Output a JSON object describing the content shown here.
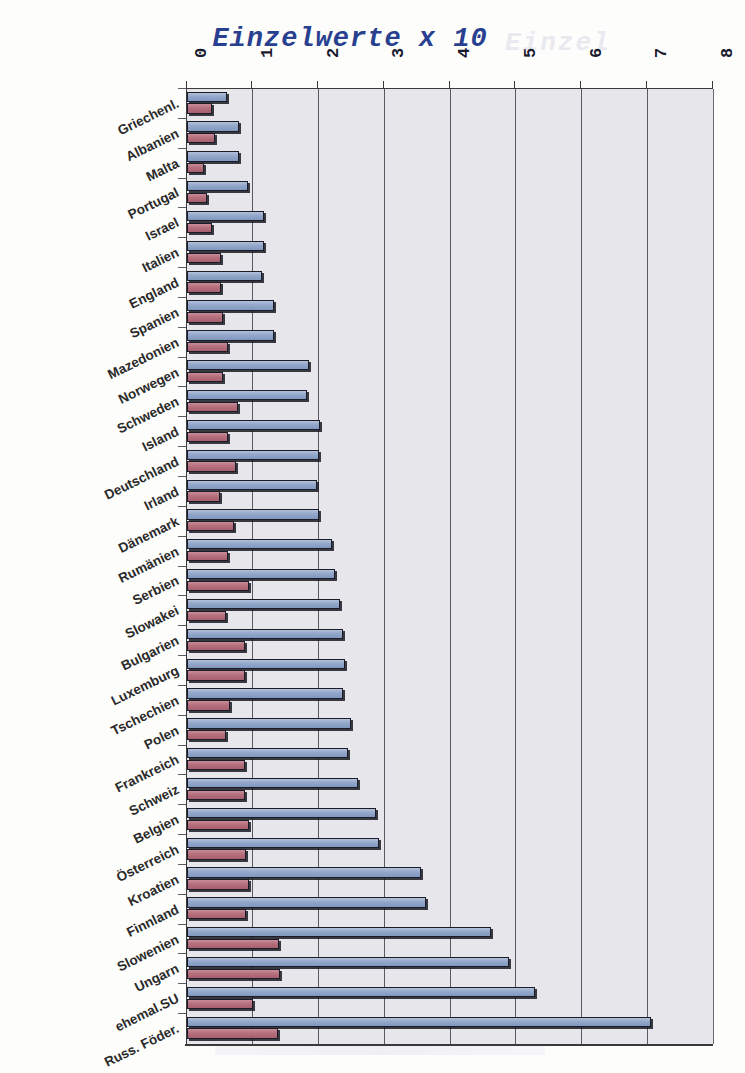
{
  "chart_data": {
    "type": "bar",
    "orientation": "horizontal",
    "title": "Einzelwerte x 10",
    "xlabel": "",
    "ylabel": "",
    "xlim": [
      0,
      8
    ],
    "xticks": [
      "0",
      "1",
      "2",
      "3",
      "4",
      "5",
      "6",
      "7",
      "8"
    ],
    "grid": "vertical",
    "legend_position": "none",
    "categories": [
      "Griechenl.",
      "Albanien",
      "Malta",
      "Portugal",
      "Israel",
      "Italien",
      "England",
      "Spanien",
      "Mazedonien",
      "Norwegen",
      "Schweden",
      "Island",
      "Deutschland",
      "Irland",
      "Dänemark",
      "Rumänien",
      "Serbien",
      "Slowakei",
      "Bulgarien",
      "Luxemburg",
      "Tschechien",
      "Polen",
      "Frankreich",
      "Schweiz",
      "Belgien",
      "Österreich",
      "Kroatien",
      "Finnland",
      "Slowenien",
      "Ungarn",
      "ehemal.SU",
      "Russ. Föder."
    ],
    "series": [
      {
        "name": "blau",
        "color": "#93a7ca",
        "values": [
          0.61,
          0.79,
          0.79,
          0.93,
          1.17,
          1.17,
          1.14,
          1.33,
          1.33,
          1.86,
          1.83,
          2.02,
          2.0,
          1.98,
          2.0,
          2.2,
          2.25,
          2.33,
          2.38,
          2.4,
          2.38,
          2.5,
          2.45,
          2.6,
          2.88,
          2.92,
          3.56,
          3.63,
          4.62,
          4.9,
          5.3,
          7.05
        ]
      },
      {
        "name": "rot",
        "color": "#b5707e",
        "values": [
          0.38,
          0.42,
          0.26,
          0.3,
          0.38,
          0.52,
          0.52,
          0.55,
          0.62,
          0.55,
          0.78,
          0.62,
          0.75,
          0.5,
          0.72,
          0.62,
          0.95,
          0.6,
          0.88,
          0.88,
          0.65,
          0.6,
          0.88,
          0.88,
          0.95,
          0.9,
          0.95,
          0.9,
          1.4,
          1.42,
          1.0,
          1.38
        ]
      }
    ]
  }
}
